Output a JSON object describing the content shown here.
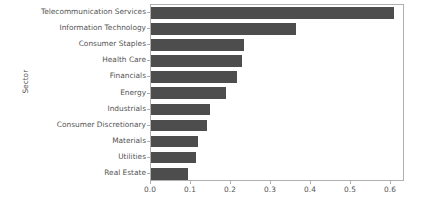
{
  "chart_data": {
    "type": "bar",
    "orientation": "horizontal",
    "title": "",
    "xlabel": "",
    "ylabel": "Sector",
    "categories": [
      "Telecommunication Services",
      "Information Technology",
      "Consumer Staples",
      "Health Care",
      "Financials",
      "Energy",
      "Industrials",
      "Consumer Discretionary",
      "Materials",
      "Utilities",
      "Real Estate"
    ],
    "values": [
      0.608,
      0.362,
      0.232,
      0.227,
      0.214,
      0.188,
      0.147,
      0.139,
      0.117,
      0.112,
      0.092
    ],
    "xlim": [
      0.0,
      0.635
    ],
    "xticks": [
      0.0,
      0.1,
      0.2,
      0.3,
      0.4,
      0.5,
      0.6
    ],
    "xtick_labels": [
      "0.0",
      "0.1",
      "0.2",
      "0.3",
      "0.4",
      "0.5",
      "0.6"
    ],
    "grid": false,
    "legend": null,
    "bar_color": "#4d4d4d",
    "axis_color": "#b0b0b0",
    "text_color": "#545454",
    "background": "#ffffff"
  }
}
